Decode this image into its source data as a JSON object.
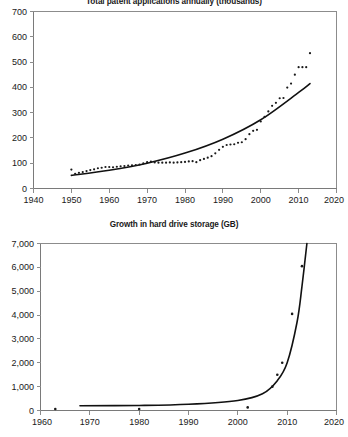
{
  "charts": {
    "top": {
      "title": "Total patent applications annually (thousands)",
      "ylabels": [
        "0",
        "100",
        "200",
        "300",
        "400",
        "500",
        "600",
        "700"
      ],
      "xlabels": [
        "1940",
        "1950",
        "1960",
        "1970",
        "1980",
        "1990",
        "2000",
        "2010",
        "2020"
      ]
    },
    "bottom": {
      "title": "Growth in hard drive storage (GB)",
      "ylabels": [
        "0",
        "1,000",
        "2,000",
        "3,000",
        "4,000",
        "5,000",
        "6,000",
        "7,000"
      ],
      "xlabels": [
        "1960",
        "1970",
        "1980",
        "1990",
        "2000",
        "2010",
        "2020"
      ]
    }
  },
  "chart_data": [
    {
      "type": "scatter",
      "title": "Total patent applications annually (thousands)",
      "xlabel": "",
      "ylabel": "",
      "xlim": [
        1940,
        2020
      ],
      "ylim": [
        0,
        700
      ],
      "xticks": [
        1940,
        1950,
        1960,
        1970,
        1980,
        1990,
        2000,
        2010,
        2020
      ],
      "yticks": [
        0,
        100,
        200,
        300,
        400,
        500,
        600,
        700
      ],
      "grid": false,
      "legend": "none",
      "series": [
        {
          "name": "Total patent applications annually (thousands)",
          "marker": "dot",
          "color": "#1a1a1a",
          "x": [
            1950,
            1951,
            1952,
            1953,
            1954,
            1955,
            1956,
            1957,
            1958,
            1959,
            1960,
            1961,
            1962,
            1963,
            1964,
            1965,
            1966,
            1967,
            1968,
            1969,
            1970,
            1971,
            1972,
            1973,
            1974,
            1975,
            1976,
            1977,
            1978,
            1979,
            1980,
            1981,
            1982,
            1983,
            1984,
            1985,
            1986,
            1987,
            1988,
            1989,
            1990,
            1991,
            1992,
            1993,
            1994,
            1995,
            1996,
            1997,
            1998,
            1999,
            2000,
            2001,
            2002,
            2003,
            2004,
            2005,
            2006,
            2007,
            2008,
            2009,
            2010,
            2011,
            2012,
            2013
          ],
          "y": [
            75,
            58,
            62,
            65,
            69,
            73,
            76,
            80,
            82,
            85,
            85,
            84,
            86,
            88,
            89,
            91,
            92,
            93,
            95,
            99,
            104,
            106,
            103,
            102,
            102,
            102,
            103,
            102,
            103,
            104,
            105,
            107,
            108,
            104,
            112,
            117,
            122,
            128,
            139,
            153,
            165,
            172,
            174,
            175,
            181,
            183,
            195,
            215,
            228,
            232,
            265,
            283,
            305,
            327,
            339,
            357,
            358,
            399,
            415,
            450,
            480,
            480,
            480,
            535,
            573
          ]
        },
        {
          "name": "exponential trend",
          "type": "line",
          "color": "#111111",
          "note": "smooth fitted exponential curve from 1950 (~52) rising to 2013 (~415)",
          "x": [
            1950,
            1960,
            1970,
            1980,
            1990,
            2000,
            2010,
            2013
          ],
          "y": [
            52,
            72,
            100,
            140,
            195,
            272,
            380,
            415
          ]
        }
      ]
    },
    {
      "type": "scatter",
      "title": "Growth in hard drive storage (GB)",
      "xlabel": "",
      "ylabel": "",
      "xlim": [
        1960,
        2020
      ],
      "ylim": [
        0,
        7000
      ],
      "xticks": [
        1960,
        1970,
        1980,
        1990,
        2000,
        2010,
        2020
      ],
      "yticks": [
        0,
        1000,
        2000,
        3000,
        4000,
        5000,
        6000,
        7000
      ],
      "grid": false,
      "legend": "none",
      "series": [
        {
          "name": "Growth in hard drive storage (GB)",
          "marker": "dot",
          "color": "#1a1a1a",
          "x": [
            1963,
            1980,
            2002,
            2007,
            2008,
            2009,
            2011,
            2013
          ],
          "y": [
            60,
            60,
            130,
            1000,
            1500,
            2000,
            4050,
            6050
          ]
        },
        {
          "name": "exponential trend",
          "type": "line",
          "color": "#111111",
          "note": "near-flat until ~2000 then near-vertical rise reaching 7000 at ~2014",
          "x": [
            1968,
            1980,
            1990,
            2000,
            2005,
            2008,
            2010,
            2012,
            2013,
            2014
          ],
          "y": [
            200,
            210,
            260,
            420,
            700,
            1250,
            2000,
            3700,
            5200,
            7000
          ]
        }
      ]
    }
  ]
}
